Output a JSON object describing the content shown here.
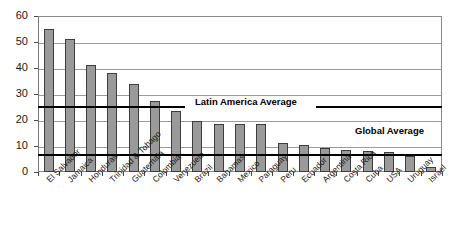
{
  "chart_data": {
    "type": "bar",
    "title": "",
    "xlabel": "",
    "ylabel": "",
    "ylim": [
      0,
      60
    ],
    "yticks": [
      0,
      10,
      20,
      30,
      40,
      50,
      60
    ],
    "grid": true,
    "legend_position": "none",
    "categories": [
      "El Salvador",
      "Jamaica",
      "Honduras",
      "Trinidad & Tobago",
      "Guatemala",
      "Colombia",
      "Venezuela",
      "Brazil",
      "Bahamas",
      "Mexico",
      "Paraguay",
      "Peru",
      "Ecuador",
      "Argentina",
      "Costa Rica",
      "Cuba",
      "USA",
      "Uruguay",
      "Israel"
    ],
    "values": [
      55,
      51,
      41,
      38,
      34,
      27.3,
      23.3,
      19.5,
      18.4,
      18.5,
      18.5,
      11.2,
      10.3,
      9.4,
      8.5,
      8.2,
      7.6,
      6.2,
      2.0
    ],
    "annotations": [
      {
        "label": "Latin America Average",
        "value": 25.5
      },
      {
        "label": "Global Average",
        "value": 6.8
      }
    ],
    "colors": {
      "bar_fill": "#9a9a9a",
      "bar_stroke": "#3d3d3d",
      "gridline": "#9b9b9b",
      "reference_line": "#000000",
      "axis": "#7a7a7a",
      "text": "#1a1a1a",
      "background": "#ffffff"
    }
  }
}
